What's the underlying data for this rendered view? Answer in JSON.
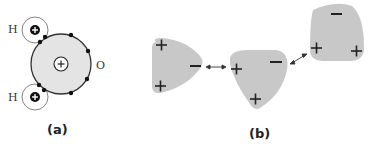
{
  "figure": {
    "panel_a": {
      "label": "(a)",
      "title": "Water molecule atomic structure",
      "atoms": {
        "oxygen": {
          "label": "O",
          "nucleus_charge": "+"
        },
        "hydrogen_top": {
          "label": "H",
          "nucleus_charge": "+"
        },
        "hydrogen_bottom": {
          "label": "H",
          "nucleus_charge": "+"
        }
      },
      "electron_count": 8
    },
    "panel_b": {
      "label": "(b)",
      "title": "Hydrogen bonding between polar water molecules",
      "molecules": [
        {
          "id": "molecule-1",
          "charges": [
            "+",
            "+",
            "−"
          ]
        },
        {
          "id": "molecule-2",
          "charges": [
            "+",
            "−",
            "+"
          ]
        },
        {
          "id": "molecule-3",
          "charges": [
            "−",
            "+",
            "+"
          ]
        }
      ],
      "bonds": [
        "double-arrow",
        "double-arrow"
      ]
    },
    "colors": {
      "molecule_fill": "#c8c8c8",
      "oxygen_fill": "#e4e4e4",
      "outline": "#333333",
      "electron": "#111111"
    }
  }
}
